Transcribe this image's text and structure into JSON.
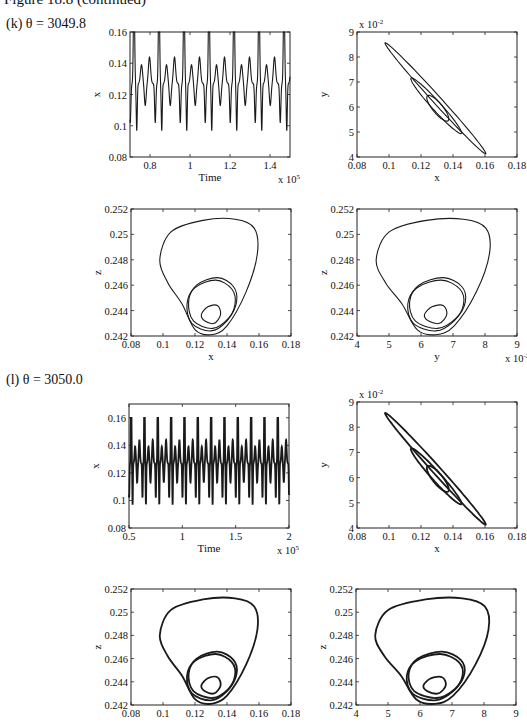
{
  "figure": {
    "caption": "Figure 18.8 (continued)"
  },
  "panels": [
    {
      "label": "(k) θ = 3049.8",
      "theta": 3049.8
    },
    {
      "label": "(l) θ = 3050.0",
      "theta": 3050.0
    }
  ],
  "chart_data": [
    {
      "panel": "k",
      "type": "line",
      "title": "",
      "xlabel": "Time",
      "ylabel": "x",
      "x_multiplier": "x 10^5",
      "xlim": [
        0.7,
        1.5
      ],
      "ylim": [
        0.08,
        0.16
      ],
      "xticks": [
        "0.8",
        "1",
        "1.2",
        "1.4"
      ],
      "yticks": [
        "0.08",
        "0.1",
        "0.12",
        "0.14",
        "0.16"
      ],
      "description": "Periodic oscillation: period ~0.125e5, each period a 0.16 peak down to 0.098 then two smaller humps (0.137, 0.145) with dip to 0.114",
      "period": 0.125,
      "max": 0.16,
      "min": 0.098,
      "secondary_peaks": [
        0.137,
        0.145
      ],
      "secondary_min": 0.114
    },
    {
      "panel": "k",
      "type": "line",
      "title": "",
      "xlabel": "x",
      "ylabel": "y",
      "y_multiplier": "x 10^-2",
      "xlim": [
        0.08,
        0.18
      ],
      "ylim": [
        4,
        9
      ],
      "xticks": [
        "0.08",
        "0.1",
        "0.12",
        "0.14",
        "0.16",
        "0.18"
      ],
      "yticks": [
        "4",
        "5",
        "6",
        "7",
        "8",
        "9"
      ],
      "description": "Phase portrait x–y: nested elongated loops along diagonal from (0.1, 8.1) to (0.16, 4.6)",
      "loops": [
        {
          "x_range": [
            0.098,
            0.16
          ],
          "y_range": [
            4.6,
            8.1
          ]
        },
        {
          "x_range": [
            0.114,
            0.145
          ],
          "y_range": [
            5.2,
            6.9
          ]
        },
        {
          "x_range": [
            0.124,
            0.137
          ],
          "y_range": [
            5.6,
            6.3
          ]
        }
      ]
    },
    {
      "panel": "k",
      "type": "line",
      "title": "",
      "xlabel": "x",
      "ylabel": "z",
      "xlim": [
        0.08,
        0.18
      ],
      "ylim": [
        0.242,
        0.252
      ],
      "xticks": [
        "0.08",
        "0.1",
        "0.12",
        "0.14",
        "0.16",
        "0.18"
      ],
      "yticks": [
        "0.242",
        "0.244",
        "0.246",
        "0.248",
        "0.25",
        "0.252"
      ],
      "description": "Phase portrait x–z: large rounded-triangle loop (z max ~0.2513) with inner loops around (0.13, 0.2438)"
    },
    {
      "panel": "k",
      "type": "line",
      "title": "",
      "xlabel": "y",
      "ylabel": "z",
      "x_multiplier": "x 10^-2",
      "xlim": [
        4,
        9
      ],
      "ylim": [
        0.242,
        0.252
      ],
      "xticks": [
        "4",
        "5",
        "6",
        "7",
        "8",
        "9"
      ],
      "yticks": [
        "0.242",
        "0.244",
        "0.246",
        "0.248",
        "0.25",
        "0.252"
      ],
      "description": "Phase portrait y–z: large loop (y 4.6–8.2) with inner loops near (5.9, 0.2438)"
    },
    {
      "panel": "l",
      "type": "line",
      "title": "",
      "xlabel": "Time",
      "ylabel": "x",
      "x_multiplier": "x 10^5",
      "xlim": [
        0.5,
        2.0
      ],
      "ylim": [
        0.08,
        0.17
      ],
      "xticks": [
        "0.5",
        "1",
        "1.5",
        "2"
      ],
      "yticks": [
        "0.08",
        "0.1",
        "0.12",
        "0.14",
        "0.16"
      ],
      "description": "Dense periodic oscillation, ~12 major peaks at 0.16 with minima 0.098 and intermediate humps ~0.137–0.145",
      "period": 0.125,
      "max": 0.16,
      "min": 0.098
    },
    {
      "panel": "l",
      "type": "line",
      "title": "",
      "xlabel": "x",
      "ylabel": "y",
      "y_multiplier": "x 10^-2",
      "xlim": [
        0.08,
        0.18
      ],
      "ylim": [
        4,
        9
      ],
      "xticks": [
        "0.08",
        "0.1",
        "0.12",
        "0.14",
        "0.16",
        "0.18"
      ],
      "yticks": [
        "4",
        "5",
        "6",
        "7",
        "8",
        "9"
      ],
      "description": "Phase portrait x–y: nested diagonal loops, thicker (multiple passes)"
    },
    {
      "panel": "l",
      "type": "line",
      "title": "",
      "xlabel": "x",
      "ylabel": "z",
      "xlim": [
        0.08,
        0.18
      ],
      "ylim": [
        0.242,
        0.252
      ],
      "xticks": [
        "0.08",
        "0.1",
        "0.12",
        "0.14",
        "0.16",
        "0.18"
      ],
      "yticks": [
        "0.242",
        "0.244",
        "0.246",
        "0.248",
        "0.25",
        "0.252"
      ],
      "description": "Phase portrait x–z: banded large loop with thickened inner loops"
    },
    {
      "panel": "l",
      "type": "line",
      "title": "",
      "xlabel": "y",
      "ylabel": "z",
      "xlim": [
        4,
        9
      ],
      "ylim": [
        0.242,
        0.252
      ],
      "xticks": [
        "4",
        "5",
        "6",
        "7",
        "8",
        "9"
      ],
      "yticks": [
        "0.242",
        "0.244",
        "0.246",
        "0.248",
        "0.25",
        "0.252"
      ],
      "description": "Phase portrait y–z: banded large loop with thickened inner loops"
    }
  ]
}
